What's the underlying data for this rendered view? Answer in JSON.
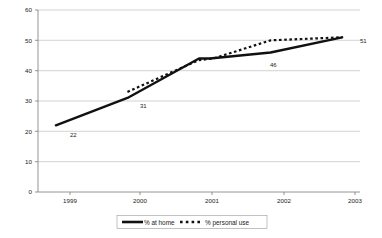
{
  "chart_data": {
    "type": "line",
    "title": "",
    "subtitle": "",
    "xlabel": "",
    "ylabel": "",
    "categories": [
      "1999",
      "2000",
      "2001",
      "2002",
      "2003"
    ],
    "x": [
      1999,
      2000,
      2001,
      2002,
      2003
    ],
    "xlim": [
      1998.75,
      2003.25
    ],
    "ylim": [
      0,
      60
    ],
    "y_ticks": [
      0,
      10,
      20,
      30,
      40,
      50,
      60
    ],
    "x_ticks": [
      "1999",
      "2000",
      "2001",
      "2002",
      "2003"
    ],
    "grid": "horizontal",
    "legend_position": "bottom-center",
    "series": [
      {
        "name": "% at home",
        "style": "solid",
        "color": "#111111",
        "x": [
          1999,
          2000,
          2001,
          2001.15,
          2002,
          2003
        ],
        "values": [
          22,
          31,
          44,
          44,
          46,
          51
        ]
      },
      {
        "name": "% personal use",
        "style": "dashed",
        "color": "#111111",
        "x": [
          2000,
          2001,
          2001.2,
          2002,
          2003
        ],
        "values": [
          33,
          43.5,
          44,
          50,
          51
        ]
      }
    ],
    "annotations": [
      {
        "label": "22",
        "series": "% at home",
        "x": 1999,
        "y": 22
      },
      {
        "label": "31",
        "series": "% at home",
        "x": 2000,
        "y": 31
      },
      {
        "label": "46",
        "series": "% at home",
        "x": 2002,
        "y": 46
      },
      {
        "label": "51",
        "series": "% at home",
        "x": 2003,
        "y": 51
      }
    ]
  },
  "axes": {
    "y_labels": [
      "60",
      "50",
      "40",
      "30",
      "20",
      "10",
      "0"
    ],
    "x_labels": [
      "1999",
      "2000",
      "2001",
      "2002",
      "2003"
    ]
  },
  "legend": {
    "items": [
      {
        "label": "% at home",
        "style": "solid"
      },
      {
        "label": "% personal use",
        "style": "dashed"
      }
    ]
  },
  "labels": {
    "p1999": "22",
    "p2000": "31",
    "p2002": "46",
    "p2003": "51"
  },
  "colors": {
    "series": "#111111",
    "grid": "#b5b5b5",
    "axis": "#7a7a7a",
    "background": "#ffffff"
  }
}
